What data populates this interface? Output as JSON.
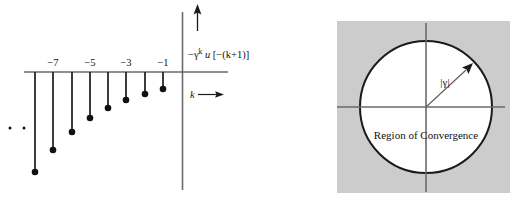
{
  "figure": {
    "title_hidden": "",
    "colors": {
      "ink": "#111111",
      "axis": "#555555",
      "stem": "#1a1a1a",
      "roc_fill": "#cccccc",
      "circle_fill": "#ffffff",
      "circle_stroke": "#1a1a1a",
      "background": "#ffffff"
    },
    "left_panel": {
      "name": "discrete-time-signal-plot",
      "signal_label": {
        "prefix": "−γ",
        "exponent": "k",
        "middle": " u",
        "argument": " [−(k+1)]",
        "full": "−γᵏ u[−(k+1)]"
      },
      "axis_label": "k",
      "axis_arrow": "→",
      "ellipsis": "·  ·",
      "tick_labels": [
        "−7",
        "−5",
        "−3",
        "−1"
      ],
      "tick_label_positions_k": [
        -7,
        -5,
        -3,
        -1
      ],
      "stems_k": [
        -8,
        -7,
        -6,
        -5,
        -4,
        -3,
        -2,
        -1
      ],
      "stem_depths_px": [
        100,
        78,
        60,
        46,
        36,
        28,
        22,
        17
      ],
      "note": "stem amplitudes are negative and decay in magnitude toward k = -1"
    },
    "right_panel": {
      "name": "region-of-convergence-plot",
      "roc_text": "Region of Convergence",
      "radius_label": "|γ|",
      "circle_radius_label": "|γ|",
      "shading_legend": "shaded area is outside the ROC"
    }
  }
}
